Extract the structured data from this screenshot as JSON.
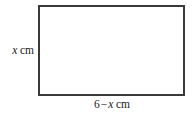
{
  "figure": {
    "type": "geometry-diagram",
    "shape": "rectangle",
    "background_color": "#ffffff",
    "stroke_color": "#3a3a3a",
    "fill_color": "#ffffff",
    "text_color": "#1a1a1a"
  },
  "labels": {
    "height": {
      "variable": "x",
      "unit": "cm",
      "full_text": "x cm",
      "side": "left"
    },
    "width": {
      "constant": "6",
      "operator": "−",
      "variable": "x",
      "unit": "cm",
      "full_text": "6 − x cm",
      "side": "bottom"
    }
  }
}
